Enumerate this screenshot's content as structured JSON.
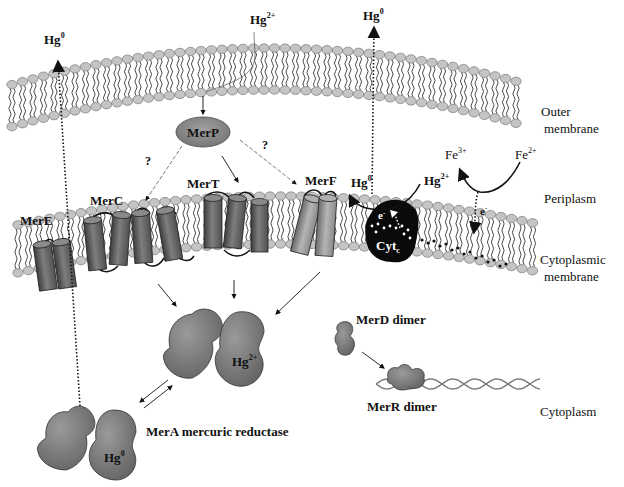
{
  "diagram": {
    "colors": {
      "background": "#ffffff",
      "lipid_head": "#c4c4c4",
      "lipid_head_stroke": "#6a6a6a",
      "lipid_tail": "#1a1a1a",
      "helix_dark": "#5a5a5a",
      "helix_light": "#9a9a9a",
      "protein_fill": "#7a7a7a",
      "merp_fill": "#8a8a8a",
      "cytc_fill": "#0a0a0a",
      "arrow": "#111111"
    },
    "regions": {
      "outer_membrane": [
        "Outer",
        "membrane"
      ],
      "periplasm": "Periplasm",
      "cytoplasmic_membrane": [
        "Cytoplasmic",
        "membrane"
      ],
      "cytoplasm": "Cytoplasm"
    },
    "species": {
      "hg2_top": {
        "base": "Hg",
        "sup": "2+"
      },
      "hg0_left": {
        "base": "Hg",
        "sup": "0"
      },
      "hg0_top_right": {
        "base": "Hg",
        "sup": "0"
      },
      "hg0_periplasm": {
        "base": "Hg",
        "sup": "0"
      },
      "hg2_periplasm": {
        "base": "Hg",
        "sup": "2+"
      },
      "fe3": {
        "base": "Fe",
        "sup": "3+"
      },
      "fe2": {
        "base": "Fe",
        "sup": "2+"
      },
      "electron_a": {
        "base": "e",
        "sup": "-"
      },
      "electron_b": {
        "base": "e",
        "sup": "-"
      },
      "hg2_mera": {
        "base": "Hg",
        "sup": "2+"
      },
      "hg0_mera": {
        "base": "Hg",
        "sup": "0"
      }
    },
    "proteins": {
      "merp": "MerP",
      "merc": "MerC",
      "mert": "MerT",
      "merf": "MerF",
      "mere": "MerE",
      "cytc": {
        "base": "Cyt",
        "sub": "c"
      },
      "merd": "MerD dimer",
      "merr": "MerR dimer",
      "mera": "MerA mercuric reductase"
    },
    "annotations": {
      "question_left": "?",
      "question_right": "?"
    }
  }
}
